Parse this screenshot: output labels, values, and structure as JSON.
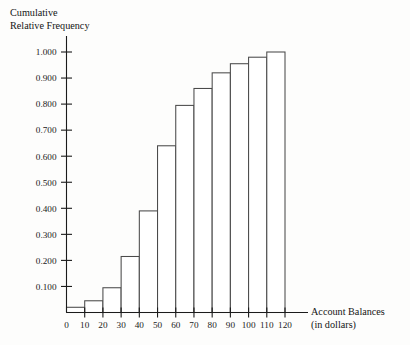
{
  "chart_data": {
    "type": "bar",
    "title": "",
    "ylabel": "Cumulative Relative Frequency",
    "ylabel_lines": [
      "Cumulative",
      "Relative Frequency"
    ],
    "xlabel": "Account Balances (in dollars)",
    "xlabel_lines": [
      "Account Balances",
      "(in dollars)"
    ],
    "categories": [
      "10",
      "20",
      "30",
      "40",
      "50",
      "60",
      "70",
      "80",
      "90",
      "100",
      "110",
      "120"
    ],
    "bin_edges": [
      0,
      10,
      20,
      30,
      40,
      50,
      60,
      70,
      80,
      90,
      100,
      110,
      120
    ],
    "values": [
      0.02,
      0.045,
      0.095,
      0.215,
      0.39,
      0.64,
      0.795,
      0.86,
      0.92,
      0.955,
      0.98,
      1.0
    ],
    "xtick_labels": [
      "0",
      "10",
      "20",
      "30",
      "40",
      "50",
      "60",
      "70",
      "80",
      "90",
      "100",
      "110",
      "120"
    ],
    "xtick_values": [
      0,
      10,
      20,
      30,
      40,
      50,
      60,
      70,
      80,
      90,
      100,
      110,
      120
    ],
    "ytick_labels": [
      "0.100",
      "0.200",
      "0.300",
      "0.400",
      "0.500",
      "0.600",
      "0.700",
      "0.800",
      "0.900",
      "1.000"
    ],
    "ytick_values": [
      0.1,
      0.2,
      0.3,
      0.4,
      0.5,
      0.6,
      0.7,
      0.8,
      0.9,
      1.0
    ],
    "xlim": [
      0,
      120
    ],
    "ylim": [
      0,
      1.0
    ],
    "grid": false,
    "legend": null,
    "bar_color": "#ffffff",
    "bar_edge_color": "#4a4a4a",
    "axis_color": "#1b1b1b"
  }
}
